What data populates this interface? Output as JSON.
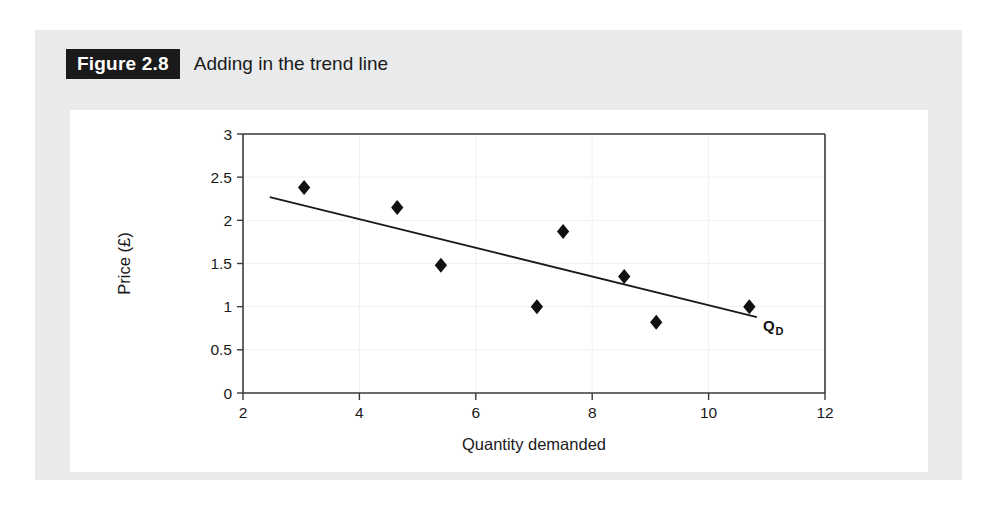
{
  "figure": {
    "badge": "Figure 2.8",
    "caption": "Adding in the trend line"
  },
  "chart_data": {
    "type": "scatter",
    "title": "Adding in the trend line",
    "xlabel": "Quantity demanded",
    "ylabel": "Price (£)",
    "xlim": [
      2,
      12
    ],
    "ylim": [
      0,
      3
    ],
    "xticks": [
      2,
      4,
      6,
      8,
      10,
      12
    ],
    "xtick_labels": [
      "2",
      "4",
      "6",
      "8",
      "10",
      "12"
    ],
    "yticks": [
      0,
      0.5,
      1,
      1.5,
      2,
      2.5,
      3
    ],
    "ytick_labels": [
      "0",
      "0.5",
      "1",
      "1.5",
      "2",
      "2.5",
      "3"
    ],
    "grid": true,
    "legend": "none",
    "series": [
      {
        "name": "Observations",
        "marker": "diamond",
        "color": "#111111",
        "points": [
          {
            "x": 3.05,
            "y": 2.38
          },
          {
            "x": 4.65,
            "y": 2.15
          },
          {
            "x": 5.4,
            "y": 1.48
          },
          {
            "x": 7.05,
            "y": 1.0
          },
          {
            "x": 7.5,
            "y": 1.87
          },
          {
            "x": 8.55,
            "y": 1.35
          },
          {
            "x": 9.1,
            "y": 0.82
          },
          {
            "x": 10.7,
            "y": 1.0
          }
        ]
      },
      {
        "name": "Trend line",
        "type": "line",
        "color": "#1a1a1a",
        "annotation": "QD",
        "annotation_base": "Q",
        "annotation_sub": "D",
        "endpoints": [
          {
            "x": 2.46,
            "y": 2.27
          },
          {
            "x": 10.83,
            "y": 0.88
          }
        ]
      }
    ]
  }
}
